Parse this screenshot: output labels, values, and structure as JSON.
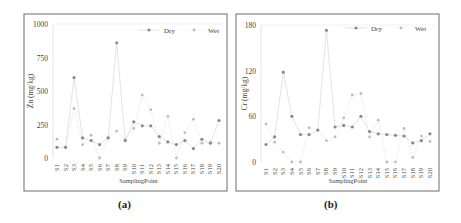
{
  "panels": [
    {
      "label": "(a)"
    },
    {
      "label": "(b)"
    }
  ],
  "colors": {
    "frame": "#6d6d6d",
    "dry": "#8a8a8a",
    "wet": "#bdbdbd",
    "text": "#444444"
  },
  "chart_data": [
    {
      "type": "line",
      "title": "",
      "panel_label": "(a)",
      "xlabel": "SamplingPoint",
      "ylabel": "Zn (mg/kg)",
      "ylim": [
        0,
        1000
      ],
      "yticks": [
        0,
        250,
        500,
        750,
        1000
      ],
      "grid": false,
      "legend_position": "upper right",
      "categories": [
        "S1",
        "S2",
        "S3",
        "S4",
        "S5",
        "S6",
        "S7",
        "S8",
        "S9",
        "S10",
        "S11",
        "S12",
        "S13",
        "S14",
        "S15",
        "S16",
        "S17",
        "S18",
        "S19",
        "S20"
      ],
      "series": [
        {
          "name": "Dry",
          "values": [
            80,
            80,
            600,
            150,
            130,
            100,
            150,
            860,
            130,
            270,
            240,
            240,
            160,
            120,
            100,
            130,
            70,
            140,
            110,
            280
          ]
        },
        {
          "name": "Wet",
          "values": [
            140,
            80,
            370,
            100,
            170,
            0,
            150,
            200,
            140,
            220,
            470,
            360,
            110,
            310,
            0,
            190,
            290,
            110,
            120,
            110
          ]
        }
      ]
    },
    {
      "type": "line",
      "title": "",
      "panel_label": "(b)",
      "xlabel": "SamplingPoint",
      "ylabel": "Cr (mg/kg)",
      "ylim": [
        0,
        180
      ],
      "yticks": [
        0,
        60,
        120,
        180
      ],
      "grid": false,
      "legend_position": "upper right",
      "categories": [
        "S1",
        "S2",
        "S3",
        "S4",
        "S5",
        "S6",
        "S7",
        "S8",
        "S9",
        "S10",
        "S11",
        "S12",
        "S13",
        "S14",
        "S15",
        "S16",
        "S17",
        "S18",
        "S19",
        "S20"
      ],
      "series": [
        {
          "name": "Dry",
          "values": [
            23,
            33,
            118,
            60,
            36,
            36,
            42,
            173,
            46,
            48,
            46,
            60,
            40,
            37,
            36,
            35,
            34,
            25,
            28,
            37
          ]
        },
        {
          "name": "Wet",
          "values": [
            50,
            26,
            13,
            0,
            0,
            45,
            42,
            28,
            33,
            58,
            88,
            90,
            33,
            55,
            0,
            0,
            44,
            6,
            34,
            27
          ]
        }
      ]
    }
  ]
}
